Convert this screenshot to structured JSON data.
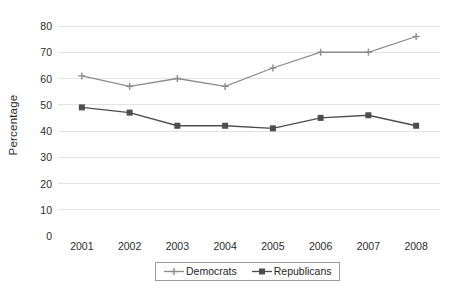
{
  "chart_data": {
    "type": "line",
    "title": "",
    "xlabel": "",
    "ylabel": "Percentage",
    "categories": [
      "2001",
      "2002",
      "2003",
      "2004",
      "2005",
      "2006",
      "2007",
      "2008"
    ],
    "x": [
      2001,
      2002,
      2003,
      2004,
      2005,
      2006,
      2007,
      2008
    ],
    "ylim": [
      0,
      80
    ],
    "yticks": [
      0,
      10,
      20,
      30,
      40,
      50,
      60,
      70,
      80
    ],
    "ytick_labels": [
      "0",
      "10",
      "20",
      "30",
      "40",
      "50",
      "60",
      "70",
      "80"
    ],
    "grid": "horizontal",
    "legend_position": "bottom-center",
    "series": [
      {
        "name": "Democrats",
        "values": [
          61,
          57,
          60,
          57,
          64,
          70,
          70,
          76
        ],
        "color": "#8c8c8c",
        "marker": "plus"
      },
      {
        "name": "Republicans",
        "values": [
          49,
          47,
          42,
          42,
          41,
          45,
          46,
          42
        ],
        "color": "#4d4d4d",
        "marker": "square"
      }
    ]
  },
  "colors": {
    "background": "#ffffff",
    "gridline": "#e3e3e3",
    "text": "#2b2b2b",
    "legend_border": "#9a9a9a",
    "democrats": "#8c8c8c",
    "republicans": "#4d4d4d"
  },
  "legend": {
    "entries": [
      {
        "label": "Democrats",
        "marker": "plus-marker"
      },
      {
        "label": "Republicans",
        "marker": "square-marker"
      }
    ]
  }
}
